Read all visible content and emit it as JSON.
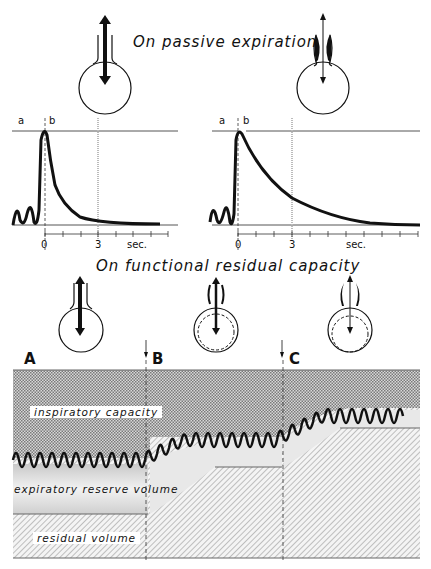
{
  "section_top": {
    "title": "On passive expiration",
    "left_graph": {
      "label_a": "a",
      "label_b": "b",
      "tick_0": "0",
      "tick_3": "3",
      "unit": "sec."
    },
    "right_graph": {
      "label_a": "a",
      "label_b": "b",
      "tick_0": "0",
      "tick_3": "3",
      "unit": "sec."
    }
  },
  "section_bottom": {
    "title": "On functional residual capacity",
    "markers": [
      "A",
      "B",
      "C"
    ],
    "regions": {
      "inspiratory": "inspiratory capacity",
      "expiratory": "expiratory reserve volume",
      "residual": "residual volume"
    }
  },
  "colors": {
    "ink": "#111111",
    "light_gray": "#e6e6e6",
    "hatch": "#777777"
  }
}
